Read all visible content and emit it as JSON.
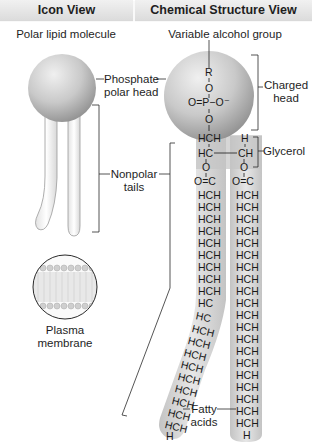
{
  "headers": {
    "icon_view": "Icon View",
    "chemical_view": "Chemical Structure View"
  },
  "icon_view": {
    "title": "Polar lipid molecule",
    "phosphate_label_line1": "Phosphate",
    "phosphate_label_line2": "polar head",
    "nonpolar_label_line1": "Nonpolar",
    "nonpolar_label_line2": "tails",
    "membrane_label_line1": "Plasma",
    "membrane_label_line2": "membrane"
  },
  "chemical_view": {
    "title": "Variable alcohol group",
    "charged_label_line1": "Charged",
    "charged_label_line2": "head",
    "glycerol_label": "Glycerol",
    "fatty_label_line1": "Fatty",
    "fatty_label_line2": "acids",
    "head_atoms": {
      "r": "R",
      "o_top": "O",
      "phosphate": "O=P−O⁻",
      "o_bottom": "O"
    },
    "glycerol_atoms": {
      "left_top": "HCH",
      "right_top": "H",
      "left_mid": "HC",
      "right_mid": "CH"
    },
    "ester_atoms": {
      "o": "O",
      "carbonyl": "O=C"
    },
    "right_chain": [
      "HCH",
      "HCH",
      "HCH",
      "HCH",
      "HCH",
      "HCH",
      "HCH",
      "HCH",
      "HCH",
      "HCH",
      "HCH",
      "HCH",
      "HCH",
      "HCH",
      "HCH",
      "HCH",
      "HCH",
      "HCH",
      "HCH",
      "H"
    ],
    "left_chain_straight": [
      "HCH",
      "HCH",
      "HCH",
      "HCH",
      "HCH",
      "HCH",
      "HCH",
      "HCH",
      "HCH",
      "HC"
    ],
    "left_chain_bent": [
      "HC",
      "HCH",
      "HCH",
      "HCH",
      "HCH",
      "HCH",
      "HCH",
      "HCH",
      "HCH",
      "HCH",
      "H"
    ]
  },
  "colors": {
    "header_bg": "#e4e4e4",
    "sphere_light": "#e6e6e6",
    "sphere_dark": "#9c9c9c",
    "tail_fill": "#d2d2d2",
    "line": "#2a2a2a"
  }
}
